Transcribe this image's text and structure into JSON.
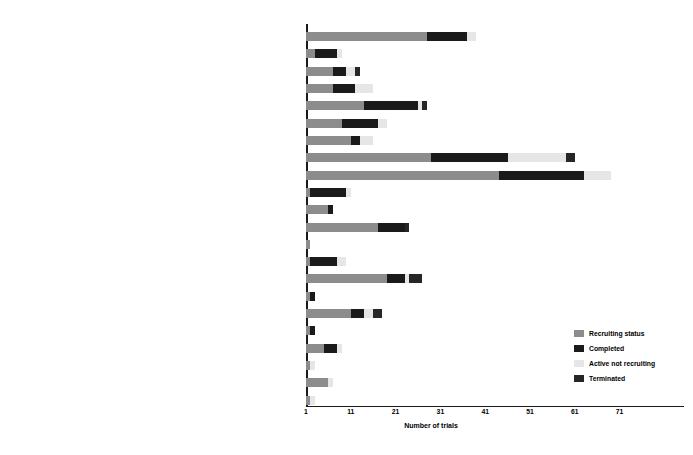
{
  "chart_data": {
    "type": "bar",
    "orientation": "horizontal",
    "stacked": true,
    "title": "",
    "xlabel": "Number of trials",
    "ylabel": "",
    "xlim": [
      1,
      85
    ],
    "xticks": [
      1,
      11,
      21,
      31,
      41,
      51,
      61,
      71
    ],
    "grid": false,
    "legend_position": "lower-right",
    "series": [
      {
        "name": "Recruiting status",
        "color": "#8c8c8c"
      },
      {
        "name": "Completed",
        "color": "#1a1a1a"
      },
      {
        "name": "Active not recruiting",
        "color": "#e6e6e6"
      },
      {
        "name": "Terminated",
        "color": "#262626"
      }
    ],
    "categories": [
      "COVID-19",
      "UNORTHODOX CLINICAL TRIALS",
      "OTHER",
      "SKIN AND DREMATOLOGICAL DISEASES",
      "WOUNDS AND INJURIES",
      "URINARY TRACT, SEXUAL ORGANS, AND PREGNANCY CONDITIONS",
      "NUTRITIONAL AND METABOLIC DISEASES",
      "BRAIN AND NEUROLOGICAL DISORDERS",
      "MUSCLE, BONE, AND CARTILAGE DISEASES",
      "MOUTH AND TOOTH DISEASES",
      "LIVER DISEASES",
      "LUNG AND BRONCHIAL DISEASES",
      "INFECTOUS DISEASES",
      "IMMUNE SYSTEM DISEASES",
      "HEART AND CARDIOVASCULAR DISEASES",
      "HAEMATOLOGICAL DISEASES",
      "GRAFT VERSUS HOST DISEASES",
      "GLAND AND HORMONE RELATED DISEASES",
      "EYE DISEASES",
      "EAR, NOSE, AND THROAT DISEASES",
      "DIGESTIVE SYSTEM DISEASES",
      "CANCERS AND OTHER NEOPLASMS"
    ],
    "values": {
      "Recruiting status": [
        27,
        2,
        6,
        6,
        13,
        8,
        10,
        28,
        43,
        1,
        5,
        16,
        1,
        1,
        18,
        1,
        10,
        1,
        4,
        1,
        5,
        1
      ],
      "Completed": [
        9,
        5,
        3,
        5,
        12,
        8,
        2,
        17,
        19,
        8,
        1,
        6,
        0,
        6,
        4,
        1,
        3,
        1,
        3,
        0,
        0,
        0
      ],
      "Active not recruiting": [
        2,
        1,
        2,
        4,
        1,
        2,
        3,
        13,
        6,
        1,
        0,
        0,
        0,
        2,
        1,
        0,
        2,
        0,
        1,
        1,
        1,
        1
      ],
      "Terminated": [
        0,
        0,
        1,
        0,
        1,
        0,
        0,
        2,
        0,
        0,
        0,
        1,
        0,
        0,
        3,
        0,
        2,
        0,
        0,
        0,
        0,
        0
      ]
    }
  },
  "legend": {
    "items": [
      {
        "label": "Recruiting status",
        "color": "#8c8c8c"
      },
      {
        "label": "Completed",
        "color": "#1a1a1a"
      },
      {
        "label": "Active not recruiting",
        "color": "#e6e6e6"
      },
      {
        "label": "Terminated",
        "color": "#262626"
      }
    ]
  }
}
